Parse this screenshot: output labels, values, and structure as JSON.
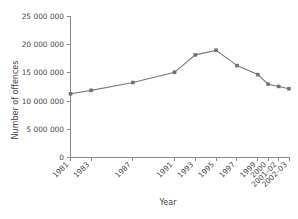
{
  "chart_data": {
    "type": "line",
    "title": "",
    "xlabel": "Year",
    "ylabel": "Number of offences",
    "categories": [
      "1981",
      "1983",
      "1987",
      "1991",
      "1993",
      "1995",
      "1997",
      "1999",
      "2000",
      "2001–02",
      "2002–03"
    ],
    "x_numeric": [
      1981,
      1983,
      1987,
      1991,
      1993,
      1995,
      1997,
      1999,
      2000,
      2001,
      2002
    ],
    "values": [
      11300000,
      11900000,
      13300000,
      15100000,
      18200000,
      19000000,
      16300000,
      14700000,
      13000000,
      12600000,
      12200000
    ],
    "series": [
      {
        "name": "Number of offences",
        "values": [
          11300000,
          11900000,
          13300000,
          15100000,
          18200000,
          19000000,
          16300000,
          14700000,
          13000000,
          12600000,
          12200000
        ]
      }
    ],
    "ylim": [
      0,
      25000000
    ],
    "xlim": [
      1981,
      2002
    ],
    "ytick_values": [
      0,
      5000000,
      10000000,
      15000000,
      20000000,
      25000000
    ],
    "ytick_labels": [
      "0",
      "5 000 000",
      "10 000 000",
      "15 000 000",
      "20 000 000",
      "25 000 000"
    ],
    "grid": false,
    "legend": false,
    "legend_position": "none",
    "marker": "square",
    "line_color": "#7a7a7a",
    "marker_color": "#6f6f6f",
    "axis_color": "#8a8a8a",
    "background_color": "#ffffff",
    "xtick_rotation_degrees": 45
  }
}
